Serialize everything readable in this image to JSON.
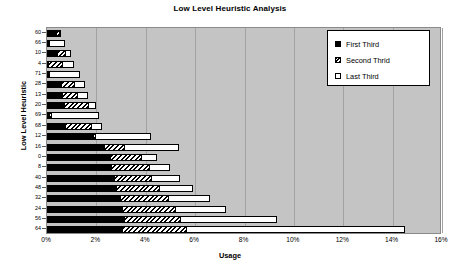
{
  "chart_data": {
    "type": "bar",
    "orientation": "horizontal",
    "stacked": true,
    "title": "Low Level Heuristic Analysis",
    "xlabel": "Usage",
    "ylabel": "Low Level Heuristic",
    "xlim": [
      0,
      16
    ],
    "x_tick_labels": [
      "0%",
      "2%",
      "4%",
      "6%",
      "8%",
      "10%",
      "12%",
      "14%",
      "16%"
    ],
    "x_tick_values": [
      0,
      2,
      4,
      6,
      8,
      10,
      12,
      14,
      16
    ],
    "grid": "vertical",
    "legend_position": "top-right",
    "plot_background": "#c4c4c4",
    "categories": [
      "60",
      "66",
      "10",
      "4",
      "71",
      "28",
      "13",
      "20",
      "69",
      "68",
      "12",
      "16",
      "0",
      "8",
      "40",
      "48",
      "32",
      "24",
      "56",
      "64"
    ],
    "series": [
      {
        "name": "First Third",
        "fill": "solid-black",
        "color": "#000000",
        "values": [
          0.38,
          0.05,
          0.42,
          0.06,
          0.05,
          0.55,
          0.62,
          0.7,
          0.07,
          0.72,
          1.85,
          2.3,
          2.55,
          2.6,
          2.7,
          2.8,
          2.95,
          3.05,
          3.1,
          3.05
        ]
      },
      {
        "name": "Second Thrid",
        "fill": "diagonal-hatch",
        "color": "#000000",
        "values": [
          0.12,
          0.05,
          0.3,
          0.55,
          0.05,
          0.55,
          0.6,
          0.95,
          0.1,
          1.05,
          0.1,
          0.8,
          1.25,
          1.55,
          1.5,
          1.75,
          1.95,
          2.15,
          2.3,
          2.6
        ]
      },
      {
        "name": "Last Third",
        "fill": "white-empty",
        "color": "#ffffff",
        "values": [
          0.02,
          0.62,
          0.25,
          0.5,
          1.25,
          0.42,
          0.45,
          0.35,
          1.95,
          0.45,
          2.25,
          2.25,
          0.65,
          0.85,
          1.2,
          1.35,
          1.7,
          2.05,
          3.9,
          8.85
        ]
      }
    ]
  },
  "legend": {
    "items": [
      {
        "label": "First Third",
        "style": "first"
      },
      {
        "label": "Second Thrid",
        "style": "second"
      },
      {
        "label": "Last Third",
        "style": "last"
      }
    ]
  }
}
